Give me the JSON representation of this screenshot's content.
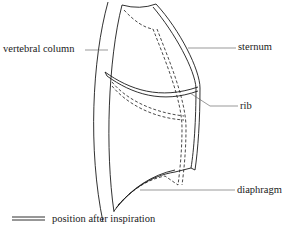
{
  "diagram": {
    "labels": {
      "vertebral_column": "vertebral column",
      "sternum": "sternum",
      "rib": "rib",
      "diaphragm": "diaphragm"
    },
    "legend": {
      "text": "position after inspiration",
      "symbol": "double-line"
    },
    "colors": {
      "stroke": "#1a1a1a",
      "leader": "#555555",
      "background": "#ffffff"
    }
  }
}
